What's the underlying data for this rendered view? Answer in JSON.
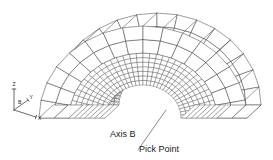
{
  "figure": {
    "background_color": "#ffffff",
    "line_color": "#3a3a3a",
    "fine_line_color": "#4a4a4a",
    "width": 273,
    "height": 160
  },
  "annotations": [
    {
      "id": "axis-b",
      "label": "Axis B",
      "x": 110,
      "y": 137
    },
    {
      "id": "pick-point",
      "label": "Pick Point",
      "x": 139,
      "y": 152
    }
  ],
  "leader_line": {
    "name": "pick-point-leader",
    "from_x": 138,
    "from_y": 150,
    "to_x": 166,
    "to_y": 110,
    "color": "#555555"
  },
  "triad": {
    "name": "coordinate-triad",
    "origin_x": 14,
    "origin_y": 110,
    "axes": [
      {
        "id": "z",
        "label": "Z",
        "dx": 0,
        "dy": -21,
        "label_dx": -1.5,
        "label_dy": -3
      },
      {
        "id": "y",
        "label": "Y",
        "dx": 14,
        "dy": -10,
        "label_dx": 1.5,
        "label_dy": -1.5
      },
      {
        "id": "x",
        "label": "X",
        "dx": 22,
        "dy": 7,
        "label_dx": 2,
        "label_dy": 2.5
      }
    ],
    "origin_label": "B",
    "origin_label_dx": 4,
    "origin_label_dy": -6
  },
  "mesh": {
    "type": "half-torus-elbow",
    "description": "Half annulus swept solid with coarse outer shell band and fine inner mesh band",
    "projection": "isometric",
    "center_x": 143,
    "center_y": 118,
    "outer_radius_x": 104,
    "outer_radius_y": 92,
    "mid_radius_x": 74,
    "mid_radius_y": 65,
    "inner_radius_x": 38,
    "inner_radius_y": 33,
    "angular_divisions_coarse": 16,
    "angular_divisions_fine": 34,
    "radial_divisions_coarse": 2,
    "radial_divisions_fine": 7,
    "depth_offset_x": 14,
    "depth_offset_y": -13,
    "start_angle_deg": 180,
    "end_angle_deg": 0
  }
}
